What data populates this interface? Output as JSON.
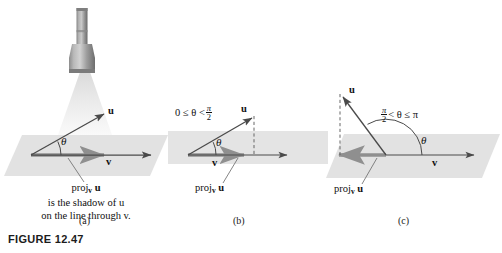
{
  "figure": {
    "number_label": "FIGURE 12.47",
    "caption_lines": [
      "is the shadow of u",
      "on the line through v."
    ],
    "caption_proj_main": "proj",
    "caption_proj_sub": "v",
    "caption_proj_arg": "u"
  },
  "symbols": {
    "u": "u",
    "v": "v",
    "theta": "θ",
    "pi": "π",
    "proj": "proj",
    "le": "≤",
    "lt": "<",
    "zero": "0"
  },
  "panels": [
    {
      "id": "a",
      "sublabel": "(a)",
      "vector_u_label": "u",
      "vector_v_label": "v",
      "angle_label": "θ",
      "has_lamp": true,
      "has_light_cone": true,
      "plane_shape": "parallelogram",
      "projection_direction": "right",
      "leader_line": true
    },
    {
      "id": "b",
      "sublabel": "(b)",
      "vector_u_label": "u",
      "vector_v_label": "v",
      "angle_label": "θ",
      "inequality": {
        "left": "0 ≤ θ <",
        "frac_num": "π",
        "frac_den": "2",
        "right": ""
      },
      "proj_label": {
        "main": "proj",
        "sub": "v",
        "arg": "u"
      },
      "plane_shape": "band",
      "projection_direction": "right",
      "dashed_drop": true,
      "leader_line": true
    },
    {
      "id": "c",
      "sublabel": "(c)",
      "vector_u_label": "u",
      "vector_v_label": "v",
      "angle_label": "θ",
      "inequality": {
        "left": "",
        "frac_num": "π",
        "frac_den": "2",
        "right": "< θ ≤ π"
      },
      "proj_label": {
        "main": "proj",
        "sub": "v",
        "arg": "u"
      },
      "plane_shape": "parallelogram",
      "projection_direction": "left",
      "dashed_drop": true,
      "leader_line": true
    }
  ],
  "colors": {
    "plane_fill": "#e2e2e2",
    "plane_fill_band": "#e4e4e4",
    "vector_stroke": "#4a4a4a",
    "proj_stroke": "#8c8c8c",
    "dashed_stroke": "#6b6b6b",
    "lamp_light": "#d9d9d9",
    "lamp_body_dark": "#6f6f6f",
    "lamp_body_mid": "#9a9a9a",
    "lamp_body_light": "#c9c9c9",
    "text": "#101010",
    "background": "#ffffff"
  }
}
